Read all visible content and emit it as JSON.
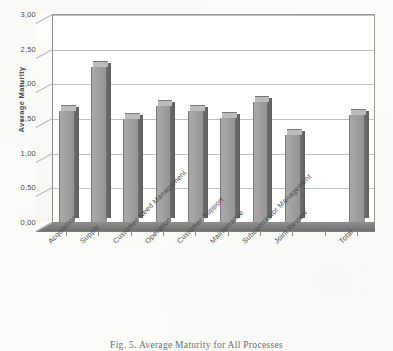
{
  "figure": {
    "caption": "Fig. 5. Average Maturity for All Processes",
    "top_cut_text": ""
  },
  "chart_data": {
    "type": "bar",
    "title": "",
    "subtitle": "",
    "xlabel": "",
    "ylabel": "Average Maturity",
    "ylim": [
      0,
      3
    ],
    "ytick_labels": [
      "0,00",
      "0,50",
      "1,00",
      "1,50",
      "2,00",
      "2,50",
      "3,00"
    ],
    "ytick_values": [
      0,
      0.5,
      1,
      1.5,
      2,
      2.5,
      3
    ],
    "grid": true,
    "legend": "none",
    "style": "3d-column",
    "decimal_separator": ",",
    "categories": [
      "Acquisition",
      "Supply",
      "Customer Need Management",
      "Operation",
      "Customer Support",
      "Maintenance",
      "Subcontractor Management",
      "Joint Review",
      "",
      "Total"
    ],
    "values": [
      1.6,
      2.23,
      1.48,
      1.68,
      1.6,
      1.5,
      1.73,
      1.25,
      null,
      1.55
    ]
  }
}
